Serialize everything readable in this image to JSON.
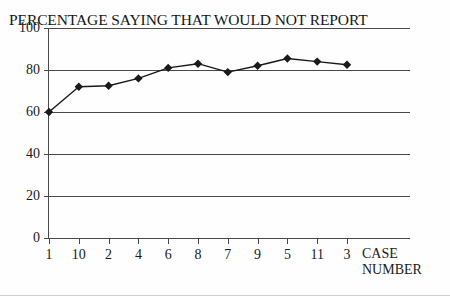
{
  "chart_data": {
    "type": "line",
    "title": "PERCENTAGE SAYING THAT WOULD NOT REPORT",
    "xlabel": "CASE NUMBER",
    "ylabel": "",
    "categories": [
      "1",
      "10",
      "2",
      "4",
      "6",
      "8",
      "7",
      "9",
      "5",
      "11",
      "3"
    ],
    "values": [
      60,
      72,
      72.5,
      76,
      81,
      83,
      79,
      82,
      85.5,
      84,
      82.5
    ],
    "ylim": [
      0,
      100
    ],
    "yticks": [
      0,
      20,
      40,
      60,
      80,
      100
    ],
    "ytick_labels": [
      "0",
      "20",
      "40",
      "60",
      "80",
      "100"
    ],
    "grid": "horizontal",
    "legend": "none",
    "marker": "diamond",
    "series": [
      {
        "name": "Percentage would not report",
        "values": [
          60,
          72,
          72.5,
          76,
          81,
          83,
          79,
          82,
          85.5,
          84,
          82.5
        ]
      }
    ]
  },
  "axis": {
    "x_title_line1": "CASE",
    "x_title_line2": "NUMBER"
  },
  "colors": {
    "line": "#1a1a1a",
    "marker": "#1a1a1a",
    "grid": "#4a4a4a",
    "text": "#1a1a1a",
    "background": "#fefefe"
  }
}
